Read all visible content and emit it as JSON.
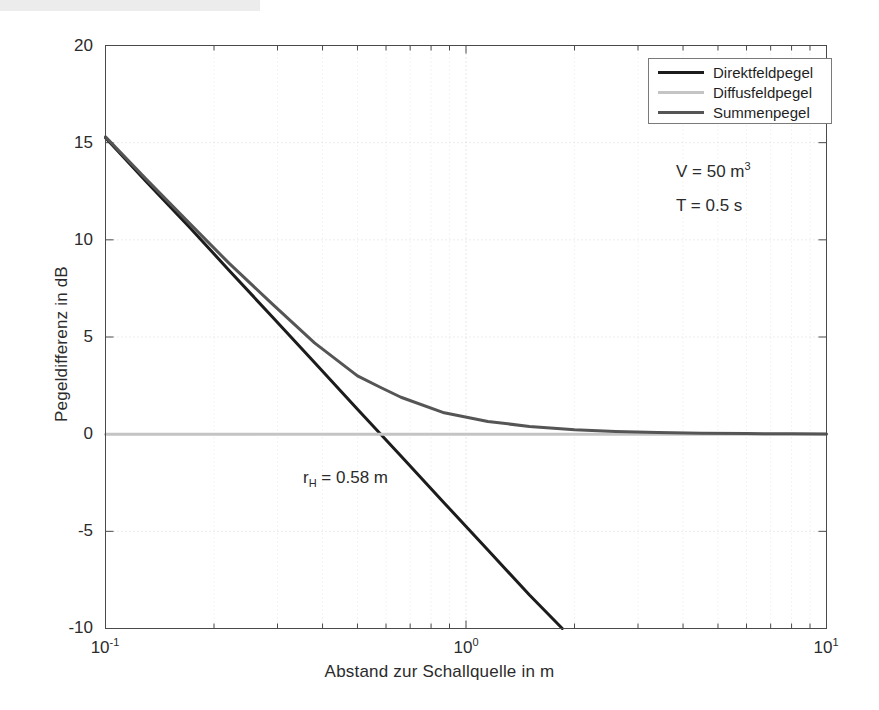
{
  "chart_data": {
    "type": "line",
    "title": "",
    "xlabel": "Abstand zur Schallquelle in m",
    "ylabel": "Pegeldifferenz in dB",
    "xscale": "log",
    "xlim": [
      0.1,
      10
    ],
    "ylim": [
      -10,
      20
    ],
    "grid": true,
    "legend_position": "top-right",
    "xticks": [
      "10-1",
      "10 0",
      "10 1"
    ],
    "xtick_values": [
      0.1,
      1,
      10
    ],
    "yticks": [
      "-10",
      "-5",
      "0",
      "5",
      "10",
      "15",
      "20"
    ],
    "ytick_values": [
      -10,
      -5,
      0,
      5,
      10,
      15,
      20
    ],
    "annotations": [
      {
        "text": "V = 50 m",
        "sup": "3",
        "x": 1.55,
        "y": 12.6
      },
      {
        "text": "T = 0.5 s",
        "sup": "",
        "x": 1.55,
        "y": 10.7
      },
      {
        "text": "r",
        "sub": "H",
        "rest": " = 0.58 m",
        "x": 0.27,
        "y": -2.6
      }
    ],
    "series": [
      {
        "name": "Direktfeldpegel",
        "color": "#1c1c1c",
        "width": 3,
        "x": [
          0.1,
          0.13,
          0.17,
          0.22,
          0.29,
          0.38,
          0.5,
          0.58,
          0.66,
          0.87,
          1.15,
          1.5,
          1.85
        ],
        "y": [
          15.25,
          12.98,
          10.7,
          8.44,
          6.04,
          3.69,
          1.28,
          0.0,
          -1.12,
          -3.54,
          -5.96,
          -8.28,
          -10.0
        ]
      },
      {
        "name": "Diffusfeldpegel",
        "color": "#c4c4c4",
        "width": 3,
        "x": [
          0.1,
          0.5,
          1,
          2,
          5,
          10
        ],
        "y": [
          0,
          0,
          0,
          0,
          0,
          0
        ]
      },
      {
        "name": "Summenpegel",
        "color": "#555555",
        "width": 3,
        "x": [
          0.1,
          0.13,
          0.17,
          0.22,
          0.29,
          0.38,
          0.5,
          0.58,
          0.66,
          0.87,
          1.15,
          1.5,
          2.0,
          2.6,
          3.4,
          4.5,
          6.0,
          8.0,
          10.0
        ],
        "y": [
          15.3,
          13.1,
          10.9,
          8.8,
          6.7,
          4.7,
          3.0,
          2.4,
          1.9,
          1.1,
          0.65,
          0.4,
          0.23,
          0.14,
          0.09,
          0.05,
          0.03,
          0.02,
          0.015
        ]
      }
    ]
  },
  "legend": {
    "entries": [
      {
        "label": "Direktfeldpegel",
        "color": "#1c1c1c"
      },
      {
        "label": "Diffusfeldpegel",
        "color": "#c4c4c4"
      },
      {
        "label": "Summenpegel",
        "color": "#555555"
      }
    ]
  },
  "axes": {
    "xlabel": "Abstand zur Schallquelle in m",
    "ylabel": "Pegeldifferenz in dB"
  },
  "annotations": {
    "volume_label": "V = 50 m",
    "volume_sup": "3",
    "reverb_label": "T = 0.5 s",
    "hall_radius_prefix": "r",
    "hall_radius_sub": "H",
    "hall_radius_rest": " = 0.58 m"
  },
  "ticks": {
    "y": [
      "20",
      "15",
      "10",
      "5",
      "0",
      "-5",
      "-10"
    ],
    "x_mantissa": [
      "10",
      "10",
      "10"
    ],
    "x_exponent": [
      "-1",
      "0",
      "1"
    ]
  }
}
